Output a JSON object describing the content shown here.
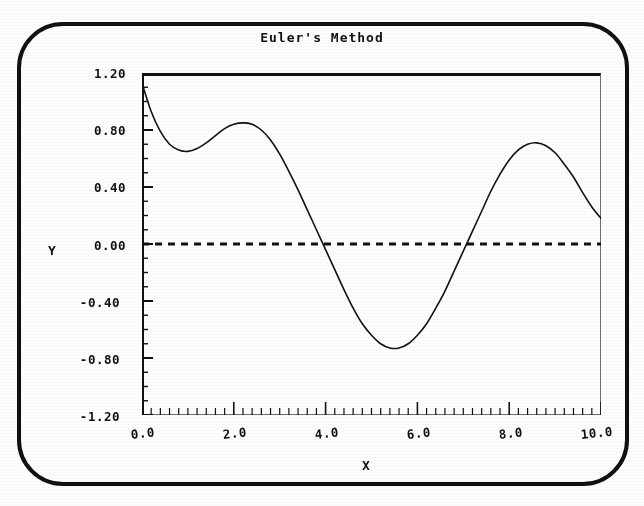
{
  "window": {
    "background_color": "#fdfdfd",
    "border_color": "#0d0d0d"
  },
  "chart_data": {
    "type": "line",
    "title": "Euler's Method",
    "xlabel": "X",
    "ylabel": "Y",
    "xlim": [
      0.0,
      10.0
    ],
    "ylim": [
      -1.2,
      1.2
    ],
    "grid": false,
    "legend": null,
    "x_major_ticks": [
      0.0,
      2.0,
      4.0,
      6.0,
      8.0,
      10.0
    ],
    "x_tick_labels": [
      "0.0",
      "2.0",
      "4.0",
      "6.0",
      "8.0",
      "10.0"
    ],
    "x_minor_tick_step": 0.2,
    "y_major_ticks": [
      1.2,
      0.8,
      0.4,
      0.0,
      -0.4,
      -0.8,
      -1.2
    ],
    "y_tick_labels": [
      "1.20",
      "0.80",
      "0.40",
      "0.00",
      "-0.40",
      "-0.80",
      "-1.20"
    ],
    "y_minor_tick_step": 0.1,
    "annotations": [
      {
        "name": "zero-reference-line",
        "type": "horizontal-dashed-line",
        "y": 0.0
      }
    ],
    "series": [
      {
        "name": "euler-solution",
        "style": "solid",
        "color": "#111111",
        "x": [
          0.0,
          0.2,
          0.4,
          0.6,
          0.8,
          1.0,
          1.2,
          1.4,
          1.6,
          1.8,
          2.0,
          2.2,
          2.4,
          2.6,
          2.8,
          3.0,
          3.2,
          3.4,
          3.6,
          3.8,
          4.0,
          4.2,
          4.4,
          4.6,
          4.8,
          5.0,
          5.2,
          5.4,
          5.6,
          5.8,
          6.0,
          6.2,
          6.4,
          6.6,
          6.8,
          7.0,
          7.2,
          7.4,
          7.6,
          7.8,
          8.0,
          8.2,
          8.4,
          8.6,
          8.8,
          9.0,
          9.2,
          9.4,
          9.6,
          9.8,
          10.0
        ],
        "y": [
          1.13,
          0.93,
          0.79,
          0.7,
          0.66,
          0.65,
          0.67,
          0.71,
          0.76,
          0.81,
          0.84,
          0.85,
          0.84,
          0.8,
          0.73,
          0.63,
          0.51,
          0.38,
          0.24,
          0.1,
          -0.04,
          -0.18,
          -0.32,
          -0.45,
          -0.56,
          -0.64,
          -0.7,
          -0.73,
          -0.73,
          -0.7,
          -0.64,
          -0.56,
          -0.45,
          -0.33,
          -0.19,
          -0.05,
          0.09,
          0.23,
          0.37,
          0.49,
          0.59,
          0.66,
          0.7,
          0.71,
          0.69,
          0.64,
          0.56,
          0.47,
          0.36,
          0.26,
          0.18
        ]
      }
    ]
  },
  "labels": {
    "title": "Euler's Method",
    "x_axis": "X",
    "y_axis": "Y"
  }
}
